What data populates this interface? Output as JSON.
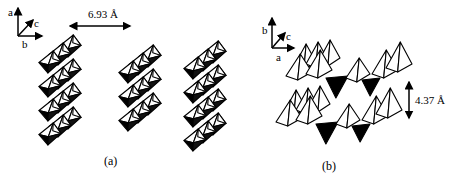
{
  "panel_a": {
    "caption": "(a)",
    "axes": {
      "up": "a",
      "diagonal": "c",
      "right": "b"
    },
    "spacing_label": "6.93 Å",
    "structure": "chains of edge-sharing octahedra",
    "chain_count": 3
  },
  "panel_b": {
    "caption": "(b)",
    "axes": {
      "up": "b",
      "diagonal": "c",
      "right": "a"
    },
    "spacing_label": "4.37 Å",
    "structure": "corrugated layers of square pyramids",
    "layer_count": 2
  }
}
